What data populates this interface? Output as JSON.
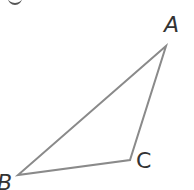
{
  "diagram": {
    "type": "triangle",
    "stroke_color": "#8a8a8a",
    "vertices": [
      {
        "id": "A",
        "label": "A",
        "x": 166,
        "y": 46
      },
      {
        "id": "B",
        "label": "B",
        "x": 18,
        "y": 175
      },
      {
        "id": "C",
        "label": "C",
        "x": 130,
        "y": 160
      }
    ],
    "labels": {
      "A": "A",
      "B": "B",
      "C": "C"
    }
  }
}
